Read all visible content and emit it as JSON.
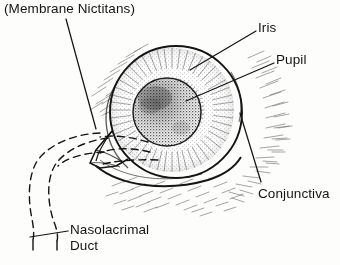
{
  "figure": {
    "width": 340,
    "height": 265,
    "background_color": "#fdfdfc",
    "ink_color": "#141414"
  },
  "labels": {
    "membrane_nictitans": "(Membrane Nictitans)",
    "iris": "Iris",
    "pupil": "Pupil",
    "conjunctiva": "Conjunctiva",
    "nasolacrimal_duct": "Nasolacrimal\nDuct"
  },
  "structures": [
    {
      "name": "eyeball",
      "kind": "circle-outline",
      "center": [
        176,
        112
      ],
      "radius": 66,
      "style": "solid"
    },
    {
      "name": "iris",
      "kind": "circle-radial-shading",
      "center": [
        172,
        110
      ],
      "radius": 62,
      "style": "stipple-radial"
    },
    {
      "name": "pupil",
      "kind": "circle-stippled",
      "center": [
        167,
        112
      ],
      "radius": 34,
      "style": "dense-stipple"
    },
    {
      "name": "nictitating-membrane",
      "kind": "wedge",
      "style": "solid"
    },
    {
      "name": "lower-eyelid",
      "kind": "curve",
      "style": "solid"
    },
    {
      "name": "conjunctiva",
      "kind": "hatching",
      "style": "short-strokes"
    },
    {
      "name": "nasolacrimal-duct",
      "kind": "loop",
      "style": "dashed"
    }
  ],
  "leader_lines": [
    {
      "name": "membrane-nictitans-leader",
      "from": [
        66,
        19
      ],
      "to": [
        96,
        129
      ]
    },
    {
      "name": "iris-leader",
      "from": [
        256,
        31
      ],
      "to": [
        190,
        70
      ]
    },
    {
      "name": "pupil-leader",
      "from": [
        274,
        63
      ],
      "to": [
        186,
        101
      ]
    },
    {
      "name": "conjunctiva-leader",
      "from": [
        261,
        182
      ],
      "to": [
        240,
        113
      ]
    },
    {
      "name": "nasolacrimal-duct-leader",
      "from": [
        68,
        231
      ],
      "to": [
        30,
        237
      ]
    }
  ]
}
